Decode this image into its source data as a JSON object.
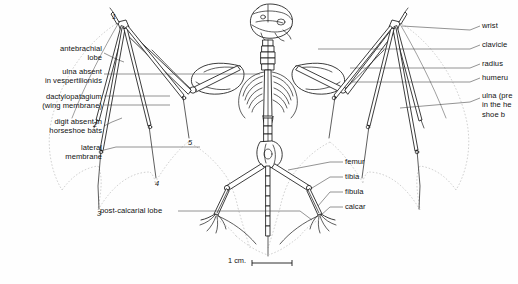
{
  "figure": {
    "background": "#fefefe",
    "ink": "#1a1a1a",
    "membrane_outline": "#b9b9b9"
  },
  "labels_left": [
    {
      "id": "antebrachial-lobe",
      "text": "antebrachial\nlobe",
      "x": 14,
      "y": 44,
      "w": 88,
      "align": "right"
    },
    {
      "id": "ulna-absent-vespertilionids",
      "text": "ulna absent\nin vespertilionids",
      "x": 6,
      "y": 67,
      "w": 96,
      "align": "right"
    },
    {
      "id": "dactylopatagium",
      "text": "dactylopatagium\n(wing membrane)",
      "x": 6,
      "y": 96,
      "w": 96,
      "align": "right"
    },
    {
      "id": "digit-absent-horseshoe-bats",
      "text": "digit absent in\nhorseshoe bats",
      "x": 6,
      "y": 119,
      "w": 96,
      "align": "right"
    },
    {
      "id": "lateral-membrane",
      "text": "lateral\nmembrane",
      "x": 14,
      "y": 147,
      "w": 88,
      "align": "right"
    }
  ],
  "labels_right": [
    {
      "id": "wrist",
      "text": "wrist",
      "x": 482,
      "y": 24
    },
    {
      "id": "clavicle",
      "text": "clavicle",
      "x": 482,
      "y": 43
    },
    {
      "id": "radius",
      "text": "radius",
      "x": 482,
      "y": 62
    },
    {
      "id": "humerus",
      "text": "humeru",
      "x": 482,
      "y": 76
    },
    {
      "id": "ulna-present-horseshoe-bats",
      "text": "ulna (pre\nin the he\nshoe b",
      "x": 482,
      "y": 94
    }
  ],
  "labels_lower_right": [
    {
      "id": "femur",
      "text": "femur",
      "x": 345,
      "y": 160
    },
    {
      "id": "tibia",
      "text": "tibia",
      "x": 345,
      "y": 174
    },
    {
      "id": "fibula",
      "text": "fibula",
      "x": 345,
      "y": 190
    },
    {
      "id": "calcar",
      "text": "calcar",
      "x": 345,
      "y": 205
    }
  ],
  "labels_bottom": [
    {
      "id": "post-calcarial-lobe",
      "text": "post-calcarial lobe",
      "x": 100,
      "y": 208
    }
  ],
  "digit_numbers": [
    {
      "id": "digit-1",
      "text": "1",
      "x": 112,
      "y": 15
    },
    {
      "id": "digit-2",
      "text": "2",
      "x": 93,
      "y": 124
    },
    {
      "id": "digit-3",
      "text": "3",
      "x": 98,
      "y": 213
    },
    {
      "id": "digit-4",
      "text": "4",
      "x": 155,
      "y": 183
    },
    {
      "id": "digit-5",
      "text": "5",
      "x": 188,
      "y": 142
    }
  ],
  "scale_bar": {
    "label": "1 cm.",
    "label_x": 228,
    "label_y": 259,
    "bar_x1": 252,
    "bar_x2": 292,
    "bar_y": 263
  }
}
